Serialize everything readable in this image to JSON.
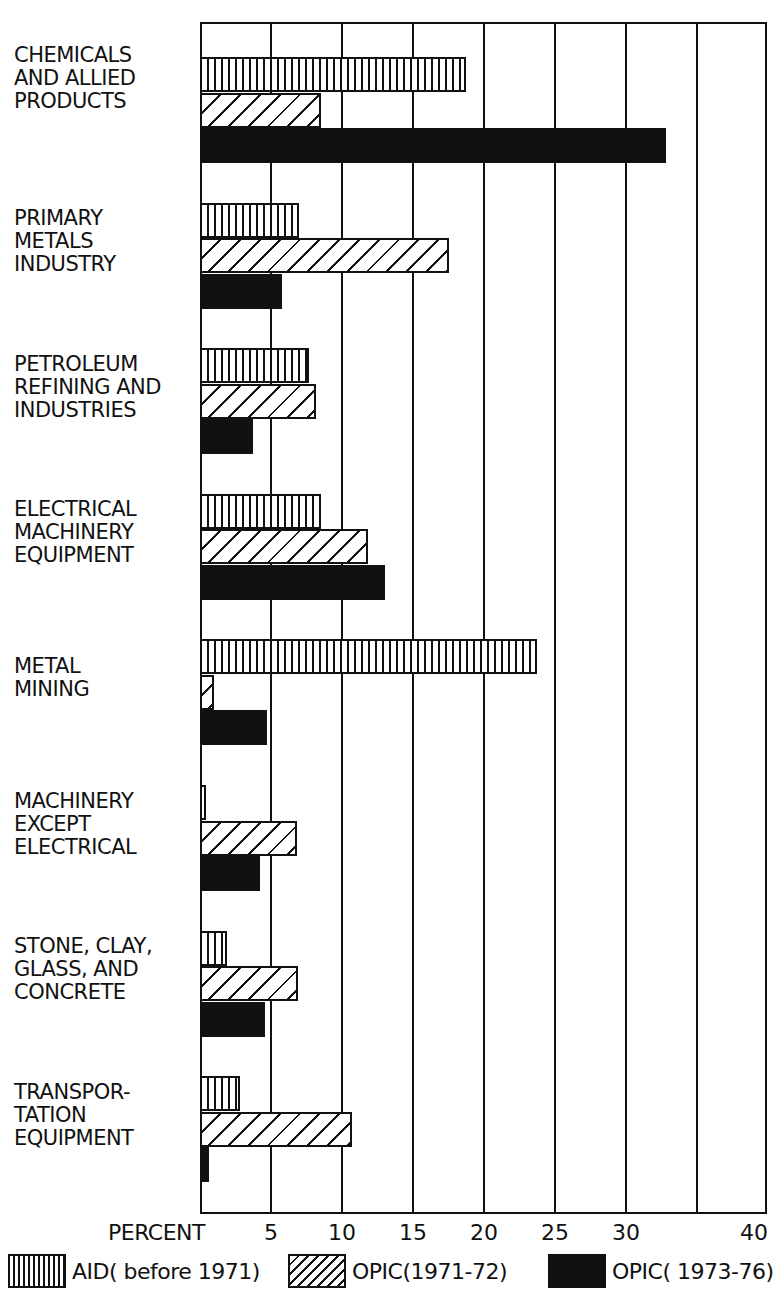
{
  "chart_data": {
    "type": "bar",
    "orientation": "horizontal",
    "title": "",
    "xlabel": "PERCENT",
    "ylabel": "",
    "xlim": [
      0,
      40
    ],
    "x_ticks": [
      "5",
      "10",
      "15",
      "20",
      "25",
      "30",
      "40"
    ],
    "grid": true,
    "legend_position": "bottom",
    "categories": [
      "CHEMICALS AND ALLIED PRODUCTS",
      "PRIMARY METALS INDUSTRY",
      "PETROLEUM REFINING AND INDUSTRIES",
      "ELECTRICAL MACHINERY EQUIPMENT",
      "METAL MINING",
      "MACHINERY EXCEPT ELECTRICAL",
      "STONE, CLAY, GLASS, AND CONCRETE",
      "TRANSPORTATION EQUIPMENT"
    ],
    "series": [
      {
        "name": "AID (before 1971)",
        "pattern": "vertical-hatch",
        "values": [
          18.7,
          7.0,
          7.7,
          8.5,
          23.7,
          0.4,
          1.9,
          2.8
        ]
      },
      {
        "name": "OPIC (1971-72)",
        "pattern": "diagonal-hatch",
        "values": [
          8.5,
          17.5,
          8.2,
          11.8,
          1.0,
          6.8,
          6.9,
          10.7
        ]
      },
      {
        "name": "OPIC (1973-76)",
        "pattern": "solid-black",
        "values": [
          32.8,
          5.8,
          3.7,
          13.0,
          4.7,
          4.2,
          4.6,
          0.6
        ]
      }
    ]
  },
  "labels": {
    "categories": [
      "CHEMICALS\nAND ALLIED\nPRODUCTS",
      "PRIMARY\nMETALS\nINDUSTRY",
      "PETROLEUM\nREFINING AND\nINDUSTRIES",
      "ELECTRICAL\nMACHINERY\nEQUIPMENT",
      "METAL\nMINING",
      "MACHINERY\nEXCEPT\nELECTRICAL",
      "STONE, CLAY,\nGLASS, AND\nCONCRETE",
      "TRANSPOR-\nTATION\nEQUIPMENT"
    ],
    "axis_title": "PERCENT",
    "ticks": [
      {
        "label": "5",
        "value": 5
      },
      {
        "label": "10",
        "value": 10
      },
      {
        "label": "15",
        "value": 15
      },
      {
        "label": "20",
        "value": 20
      },
      {
        "label": "25",
        "value": 25
      },
      {
        "label": "30",
        "value": 30
      },
      {
        "label": "40",
        "value": 40
      }
    ],
    "legend": [
      {
        "label": "AID( before 1971)",
        "class": "aid"
      },
      {
        "label": "OPIC(1971-72)",
        "class": "opic1"
      },
      {
        "label": "OPIC( 1973-76)",
        "class": "opic2"
      }
    ]
  }
}
